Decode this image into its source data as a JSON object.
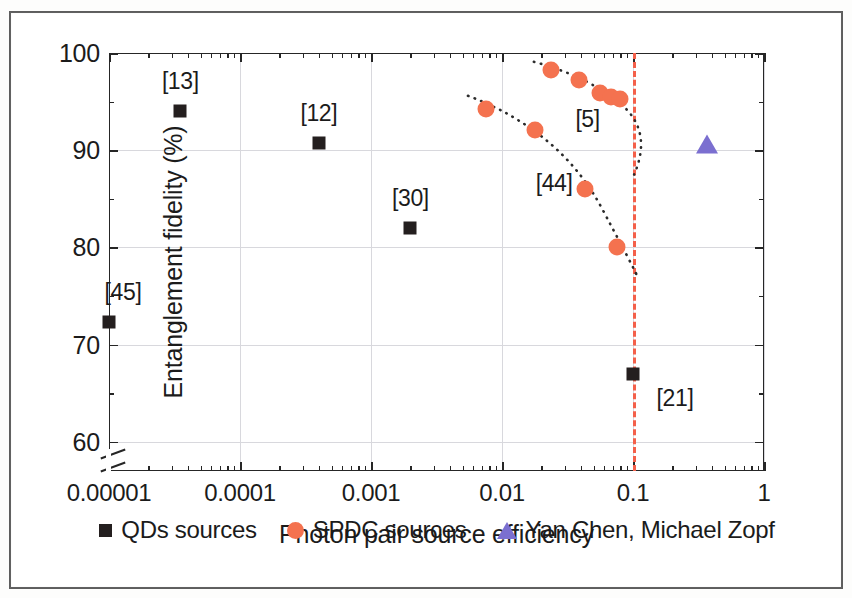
{
  "chart_data": {
    "type": "scatter",
    "title": "",
    "xlabel": "Photon pair source efficiency",
    "ylabel": "Entanglement fidelity (%)",
    "xscale": "log",
    "xlim": [
      1e-05,
      1
    ],
    "ylim": [
      57,
      100
    ],
    "y_broken_axis_below": 58,
    "grid": true,
    "legend_position": "bottom",
    "xticks": [
      {
        "value": 1e-05,
        "label": "0.00001"
      },
      {
        "value": 0.0001,
        "label": "0.0001"
      },
      {
        "value": 0.001,
        "label": "0.001"
      },
      {
        "value": 0.01,
        "label": "0.01"
      },
      {
        "value": 0.1,
        "label": "0.1"
      },
      {
        "value": 1,
        "label": "1"
      }
    ],
    "yticks": [
      {
        "value": 60,
        "label": "60"
      },
      {
        "value": 70,
        "label": "70"
      },
      {
        "value": 80,
        "label": "80"
      },
      {
        "value": 90,
        "label": "90"
      },
      {
        "value": 100,
        "label": "100"
      }
    ],
    "yminor": [
      65,
      75,
      85,
      95
    ],
    "series": [
      {
        "name": "QDs sources",
        "marker": "square",
        "color": "#241f1f",
        "points": [
          {
            "x": 1e-05,
            "y": 72.3,
            "label": "[45]",
            "label_dx": 14,
            "label_dy": -30
          },
          {
            "x": 3.5e-05,
            "y": 94.0,
            "label": "[13]",
            "label_dy": -30
          },
          {
            "x": 0.0004,
            "y": 90.7,
            "label": "[12]",
            "label_dy": -30
          },
          {
            "x": 0.002,
            "y": 82.0,
            "label": "[30]",
            "label_dy": -30
          },
          {
            "x": 0.1,
            "y": 67.0,
            "label": "[21]",
            "label_dx": 42,
            "label_dy": 24
          }
        ]
      },
      {
        "name": "SPDC sources",
        "marker": "circle",
        "color": "#f4724f",
        "points": [
          {
            "x": 0.0235,
            "y": 98.2
          },
          {
            "x": 0.039,
            "y": 97.2
          },
          {
            "x": 0.056,
            "y": 95.9
          },
          {
            "x": 0.068,
            "y": 95.5
          },
          {
            "x": 0.079,
            "y": 95.3
          },
          {
            "x": 0.0075,
            "y": 94.2
          },
          {
            "x": 0.018,
            "y": 92.1
          },
          {
            "x": 0.043,
            "y": 86.0
          },
          {
            "x": 0.075,
            "y": 80.0
          }
        ],
        "annotations": [
          {
            "text": "[5]",
            "x": 0.045,
            "y": 93.2
          },
          {
            "text": "[44]",
            "x": 0.025,
            "y": 86.6
          }
        ]
      },
      {
        "name": "Yan Chen, Michael Zopf",
        "marker": "triangle",
        "color": "#7b6fd0",
        "points": [
          {
            "x": 0.37,
            "y": 90.5
          }
        ]
      }
    ],
    "reference_line": {
      "orientation": "vertical",
      "x": 0.1,
      "color": "#f4604a",
      "style": "dashed"
    },
    "trend_curves": [
      {
        "name": "spdc-upper-trend",
        "style": "dotted",
        "color": "#2b2b2b"
      },
      {
        "name": "spdc-lower-trend",
        "style": "dotted",
        "color": "#2b2b2b"
      }
    ]
  },
  "legend": {
    "items": [
      {
        "label": "QDs sources",
        "marker": "square",
        "color": "#241f1f"
      },
      {
        "label": "SPDC sources",
        "marker": "circle",
        "color": "#f4724f"
      },
      {
        "label": "Yan Chen, Michael Zopf",
        "marker": "triangle",
        "color": "#7b6fd0"
      }
    ]
  }
}
